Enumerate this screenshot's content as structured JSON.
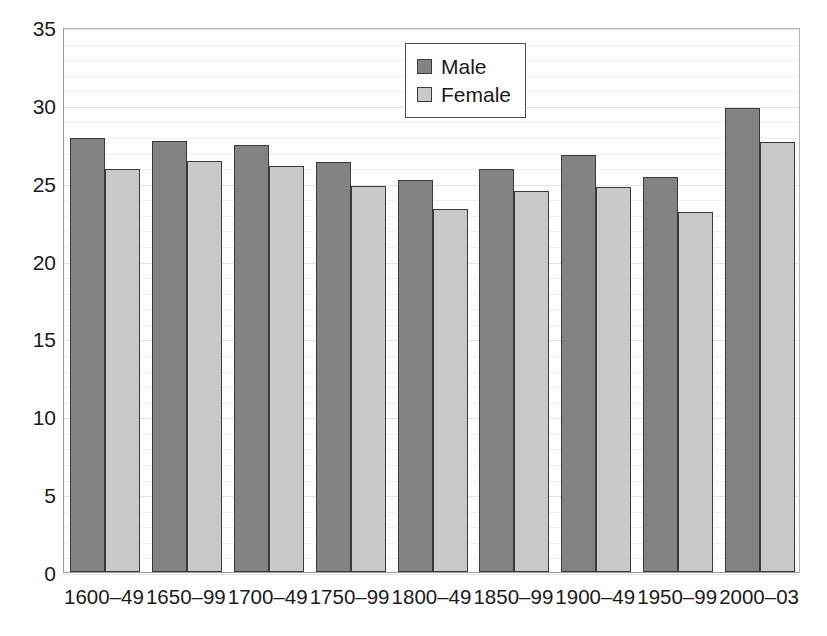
{
  "chart_data": {
    "type": "bar",
    "title": "",
    "subtitle": "",
    "xlabel": "",
    "ylabel": "",
    "ylim": [
      0,
      35
    ],
    "ytick_step": 5,
    "y_minor_step": 1,
    "grid": true,
    "grid_axis": "y",
    "legend_position": "top-center",
    "categories": [
      "1600–49",
      "1650–99",
      "1700–49",
      "1750–99",
      "1800–49",
      "1850–99",
      "1900–49",
      "1950–99",
      "2000–03"
    ],
    "ytick_labels": [
      "0",
      "5",
      "10",
      "15",
      "20",
      "25",
      "30",
      "35"
    ],
    "ytick_values": [
      0,
      5,
      10,
      15,
      20,
      25,
      30,
      35
    ],
    "series": [
      {
        "name": "Male",
        "color": "#838383",
        "values": [
          27.9,
          27.7,
          27.4,
          26.3,
          25.2,
          25.9,
          26.8,
          25.4,
          29.8
        ]
      },
      {
        "name": "Female",
        "color": "#c9c9c9",
        "values": [
          25.9,
          26.4,
          26.1,
          24.8,
          23.3,
          24.5,
          24.7,
          23.1,
          27.6
        ]
      }
    ]
  },
  "legend": {
    "entries": [
      {
        "label": "Male",
        "swatch": "male-swatch"
      },
      {
        "label": "Female",
        "swatch": "female-swatch"
      }
    ]
  },
  "colors": {
    "male_fill": "#838383",
    "female_fill": "#c9c9c9",
    "bar_outline": "#3a3a3a",
    "axis_line": "#9a9a9a",
    "grid_major": "#e2e2e2",
    "grid_minor": "#f0f0f0",
    "text": "#1a1a1a"
  }
}
